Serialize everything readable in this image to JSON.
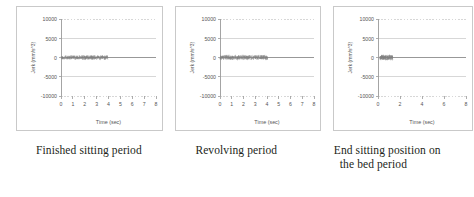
{
  "figure": {
    "panel_count": 3
  },
  "panels": [
    {
      "caption": "Finished sitting period",
      "caption_line2": ""
    },
    {
      "caption": "Revolving period",
      "caption_line2": ""
    },
    {
      "caption": "End sitting position on",
      "caption_line2": "the bed period"
    }
  ],
  "chart_data": [
    {
      "type": "scatter",
      "title": "",
      "xlabel": "Time (sec)",
      "ylabel": "Jerk (mm/s^3)",
      "xlim": [
        0,
        8
      ],
      "ylim": [
        -10000,
        10000
      ],
      "xticks": [
        0,
        1,
        2,
        3,
        4,
        5,
        6,
        7,
        8
      ],
      "xticklabels": [
        "0",
        "1",
        "2",
        "3",
        "4",
        "5",
        "6",
        "7",
        "8"
      ],
      "yticks": [
        -10000,
        -5000,
        0,
        5000,
        10000
      ],
      "yticklabels": [
        "-10000",
        "-5000",
        "0",
        "5000",
        "10000"
      ],
      "grid": true,
      "legend": "none",
      "series": [
        {
          "name": "Jerk",
          "color": "#808080",
          "x_start": 0.0,
          "x_end": 3.95,
          "noise_amplitude": 700,
          "baseline": 0,
          "point_count": 420,
          "tail_line_to_x": 8
        }
      ]
    },
    {
      "type": "scatter",
      "title": "",
      "xlabel": "Time (sec)",
      "ylabel": "Jerk (mm/s^3)",
      "xlim": [
        0,
        8
      ],
      "ylim": [
        -10000,
        10000
      ],
      "xticks": [
        0,
        1,
        2,
        3,
        4,
        5,
        6,
        7,
        8
      ],
      "xticklabels": [
        "0",
        "1",
        "2",
        "3",
        "4",
        "5",
        "6",
        "7",
        "8"
      ],
      "yticks": [
        -10000,
        -5000,
        0,
        5000,
        10000
      ],
      "yticklabels": [
        "-10000",
        "-5000",
        "0",
        "5000",
        "10000"
      ],
      "grid": true,
      "legend": "none",
      "series": [
        {
          "name": "Jerk",
          "color": "#808080",
          "x_start": 0.0,
          "x_end": 4.05,
          "noise_amplitude": 760,
          "baseline": 0,
          "point_count": 430,
          "tail_line_to_x": 8
        }
      ]
    },
    {
      "type": "scatter",
      "title": "",
      "xlabel": "Time (sec)",
      "ylabel": "Jerk (mm/s^3)",
      "xlim": [
        0,
        8
      ],
      "ylim": [
        -10000,
        10000
      ],
      "xticks": [
        0,
        2,
        4,
        6,
        8
      ],
      "xticklabels": [
        "0",
        "2",
        "4",
        "6",
        "8"
      ],
      "yticks": [
        -10000,
        -5000,
        0,
        5000,
        10000
      ],
      "yticklabels": [
        "-10000",
        "-5000",
        "0",
        "5000",
        "10000"
      ],
      "grid": true,
      "legend": "none",
      "series": [
        {
          "name": "Jerk",
          "color": "#808080",
          "x_start": 0.18,
          "x_end": 1.35,
          "noise_amplitude": 820,
          "baseline": 0,
          "point_count": 190,
          "tail_line_to_x": 8
        }
      ]
    }
  ],
  "style": {
    "axis_color": "#9a9a9a",
    "grid_color": "#bdbdbd",
    "data_color": "#808080",
    "tick_text_color": "#555555",
    "caption_color": "#231f20",
    "panel_border": "#c9c9c9"
  }
}
